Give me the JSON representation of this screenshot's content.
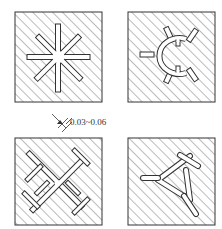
{
  "figure": {
    "panels": [
      {
        "id": "a",
        "shape": "eight-spoke-star"
      },
      {
        "id": "b",
        "shape": "c-ring-with-spokes"
      },
      {
        "id": "c",
        "shape": "crossed-t-grid"
      },
      {
        "id": "d",
        "shape": "triangle-with-spokes"
      }
    ],
    "dimension_label": "0.03~0.06"
  },
  "colors": {
    "line": "#333333",
    "hatch": "#555555",
    "background": "#ffffff"
  }
}
